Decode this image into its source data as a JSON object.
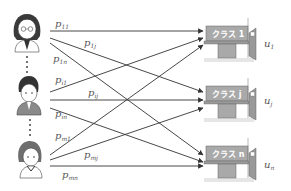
{
  "diagram": {
    "students": [
      {
        "id": "student-1",
        "label": "1"
      },
      {
        "id": "student-i",
        "label": "i"
      },
      {
        "id": "student-m",
        "label": "m"
      }
    ],
    "classes": [
      {
        "id": "class-1",
        "board_label": "クラス 1",
        "utility_main": "u",
        "utility_sub": "1"
      },
      {
        "id": "class-j",
        "board_label": "クラス j",
        "utility_main": "u",
        "utility_sub": "j"
      },
      {
        "id": "class-n",
        "board_label": "クラス n",
        "utility_main": "u",
        "utility_sub": "n"
      }
    ],
    "edge_labels": {
      "p11": {
        "main": "p",
        "sub": "11"
      },
      "p1j": {
        "main": "p",
        "sub": "1j"
      },
      "p1n": {
        "main": "p",
        "sub": "1n"
      },
      "pi1": {
        "main": "p",
        "sub": "i1"
      },
      "pij": {
        "main": "p",
        "sub": "ij"
      },
      "pin": {
        "main": "p",
        "sub": "in"
      },
      "pm1": {
        "main": "p",
        "sub": "m1"
      },
      "pmj": {
        "main": "p",
        "sub": "mj"
      },
      "pmn": {
        "main": "p",
        "sub": "mn"
      }
    },
    "colors": {
      "line": "#333333",
      "board": "#a9a9a9",
      "label": "#555555"
    }
  }
}
